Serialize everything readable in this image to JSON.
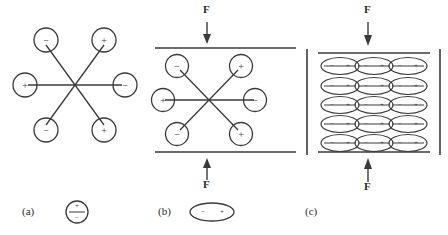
{
  "figure": {
    "background": "#ffffff",
    "line_color": "#3a3a3a",
    "text_color": "#2b2b2b"
  },
  "panels": [
    {
      "id": "a",
      "label": "(a)",
      "caption_symbol": "circle-dipole-vertical",
      "has_plates": false,
      "has_force": false,
      "dipoles": [
        {
          "sign_a": "−",
          "sign_b": "+",
          "orientation": "diagonal-down-right"
        },
        {
          "sign_a": "+",
          "sign_b": "−",
          "orientation": "horizontal"
        },
        {
          "sign_a": "−",
          "sign_b": "+",
          "orientation": "diagonal-up-right"
        }
      ],
      "legend": {
        "top_sign": "+",
        "bottom_sign": "−"
      }
    },
    {
      "id": "b",
      "label": "(b)",
      "caption_symbol": "ellipse-dipole-horizontal",
      "has_plates": true,
      "has_force": true,
      "force_top_label": "F",
      "force_bottom_label": "F",
      "dipoles": [
        {
          "sign_a": "−",
          "sign_b": "+",
          "orientation": "diagonal-down-right"
        },
        {
          "sign_a": "+",
          "sign_b": "−",
          "orientation": "horizontal"
        },
        {
          "sign_a": "−",
          "sign_b": "+",
          "orientation": "diagonal-up-right"
        }
      ],
      "legend": {
        "left_sign": "−",
        "right_sign": "+"
      }
    },
    {
      "id": "c",
      "label": "(c)",
      "caption_symbol": "none",
      "has_plates": true,
      "has_force": true,
      "has_side_walls": true,
      "force_top_label": "F",
      "force_bottom_label": "F",
      "grid": {
        "rows": 5,
        "cols": 3,
        "cell_left_sign": "−",
        "cell_right_sign": "+"
      }
    }
  ]
}
